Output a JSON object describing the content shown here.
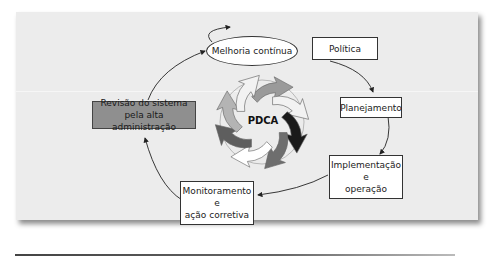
{
  "diagram": {
    "center_label": "PDCA",
    "nodes": {
      "melhoria": {
        "label": "Melhoria contínua",
        "shape": "ellipse"
      },
      "politica": {
        "label": "Política",
        "shape": "box"
      },
      "planejamento": {
        "label": "Planejamento",
        "shape": "box"
      },
      "implementacao": {
        "line1": "Implementação",
        "line2": "e",
        "line3": "operação",
        "shape": "box"
      },
      "monitoramento": {
        "line1": "Monitoramento",
        "line2": "e",
        "line3": "ação corretiva",
        "shape": "box"
      },
      "revisao": {
        "line1": "Revisão do sistema",
        "line2": "pela alta administração",
        "shape": "box",
        "fill": "#8f8f8f"
      }
    },
    "flow": [
      "Política → Planejamento",
      "Planejamento → Implementação e operação",
      "Implementação e operação → Monitoramento e ação corretiva",
      "Monitoramento e ação corretiva → Revisão do sistema pela alta administração",
      "Revisão do sistema pela alta administração → Melhoria contínua"
    ],
    "cycle_arrow_colors": [
      "#9a9a9a",
      "#f2f2f2",
      "#1a1a1a",
      "#6e6e6e",
      "#ffffff",
      "#5e5e5e",
      "#b4b4b4",
      "#f2f2f2"
    ],
    "colors": {
      "panel_bg": "#ececec",
      "box_fill": "#ffffff",
      "highlight_box_fill": "#8f8f8f",
      "line": "#222222"
    }
  }
}
